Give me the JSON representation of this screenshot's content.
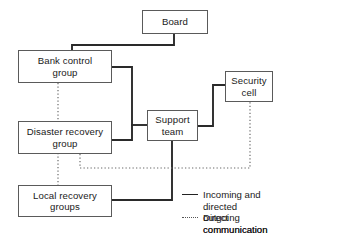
{
  "diagram": {
    "nodes": [
      {
        "id": "board",
        "label": "Board",
        "x": 142,
        "y": 10,
        "w": 66,
        "h": 24
      },
      {
        "id": "bank",
        "label": "Bank control\ngroup",
        "x": 18,
        "y": 50,
        "w": 94,
        "h": 33
      },
      {
        "id": "disaster",
        "label": "Disaster recovery\ngroup",
        "x": 18,
        "y": 121,
        "w": 94,
        "h": 33
      },
      {
        "id": "local",
        "label": "Local recovery\ngroups",
        "x": 18,
        "y": 185,
        "w": 94,
        "h": 32
      },
      {
        "id": "support",
        "label": "Support\nteam",
        "x": 147,
        "y": 110,
        "w": 51,
        "h": 31
      },
      {
        "id": "security",
        "label": "Security\ncell",
        "x": 225,
        "y": 71,
        "w": 48,
        "h": 31
      }
    ],
    "edges": [
      {
        "id": "board-to-bank",
        "kind": "solid",
        "from": "board",
        "to": "bank",
        "points": "174,34 174,45 72,45 72,50"
      },
      {
        "id": "bank-to-support-bus",
        "kind": "solid",
        "from": "bank",
        "to": "support",
        "points": "112,67 132,67 132,140 112,140"
      },
      {
        "id": "bus-to-support",
        "kind": "solid",
        "from": "bank",
        "to": "support",
        "points": "132,125 147,125"
      },
      {
        "id": "support-to-security",
        "kind": "solid",
        "from": "support",
        "to": "security",
        "points": "198,126 213,126 213,85 225,85"
      },
      {
        "id": "support-to-local",
        "kind": "solid",
        "from": "support",
        "to": "local",
        "points": "172,141 172,200 112,200"
      },
      {
        "id": "bank-to-local-dotted",
        "kind": "dotted",
        "from": "bank",
        "to": "local",
        "points": "58,83 58,185"
      },
      {
        "id": "disaster-to-security-dotted",
        "kind": "dotted",
        "from": "disaster",
        "to": "security",
        "points": "80,154 80,168 250,168 250,102"
      }
    ],
    "legend": {
      "items": [
        {
          "id": "legend-solid",
          "marker": "solid-line",
          "label": "Incoming and directed\noutgoing communication flow",
          "x": 182,
          "y": 189
        },
        {
          "id": "legend-dotted",
          "marker": "dotted-line",
          "label": "Direct communication flow",
          "x": 182,
          "y": 212
        }
      ]
    },
    "colors": {
      "box_border": "#5a5a5a",
      "solid_line": "#2a2a2a",
      "dotted_line": "#6a6a6a",
      "text": "#1a1a1a",
      "background": "#ffffff"
    }
  }
}
